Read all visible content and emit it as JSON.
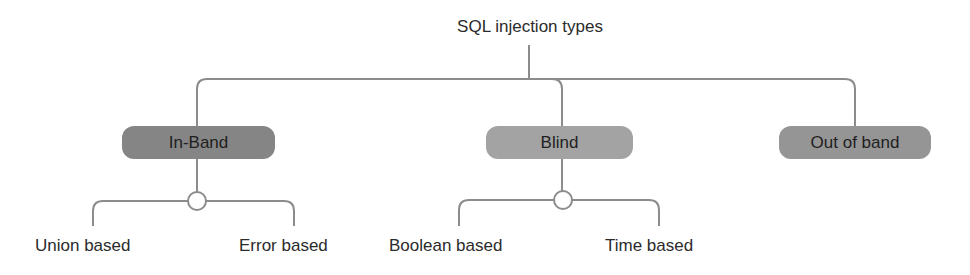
{
  "diagram": {
    "title": "SQL injection types",
    "colors": {
      "line": "#8c8c8c",
      "in_band_fill": "#858585",
      "blind_fill": "#a3a3a3",
      "out_of_band_fill": "#959595",
      "text": "#2b2b2b",
      "background": "#ffffff"
    },
    "categories": [
      {
        "label": "In-Band",
        "children": [
          "Union based",
          "Error based"
        ]
      },
      {
        "label": "Blind",
        "children": [
          "Boolean based",
          "Time based"
        ]
      },
      {
        "label": "Out of band",
        "children": []
      }
    ]
  }
}
